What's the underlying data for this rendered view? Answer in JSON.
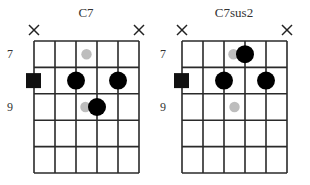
{
  "diagrams": [
    {
      "title": "C7",
      "fret_labels": [
        {
          "text": "7",
          "fret": 1
        },
        {
          "text": "9",
          "fret": 3
        }
      ],
      "strings": 6,
      "frets": 5,
      "muted_strings": [
        1,
        6
      ],
      "root_markers": [
        {
          "string": 1,
          "fret": 2
        }
      ],
      "finger_dots": [
        {
          "string": 3,
          "fret": 2
        },
        {
          "string": 5,
          "fret": 2
        },
        {
          "string": 4,
          "fret": 3
        }
      ],
      "ghost_dots": [
        {
          "string": 3.5,
          "fret": 1
        },
        {
          "string": 3.45,
          "fret": 3
        }
      ]
    },
    {
      "title": "C7sus2",
      "fret_labels": [
        {
          "text": "7",
          "fret": 1
        },
        {
          "text": "9",
          "fret": 3
        }
      ],
      "strings": 6,
      "frets": 5,
      "muted_strings": [
        1,
        6
      ],
      "root_markers": [
        {
          "string": 1,
          "fret": 2
        }
      ],
      "finger_dots": [
        {
          "string": 4,
          "fret": 1
        },
        {
          "string": 3,
          "fret": 2
        },
        {
          "string": 5,
          "fret": 2
        }
      ],
      "ghost_dots": [
        {
          "string": 3.45,
          "fret": 1
        },
        {
          "string": 3.5,
          "fret": 3
        }
      ]
    }
  ],
  "colors": {
    "finger_dot": "#000000",
    "ghost_dot": "#bdbdbd",
    "root_marker": "#111111",
    "grid": "#2a2a2a"
  }
}
